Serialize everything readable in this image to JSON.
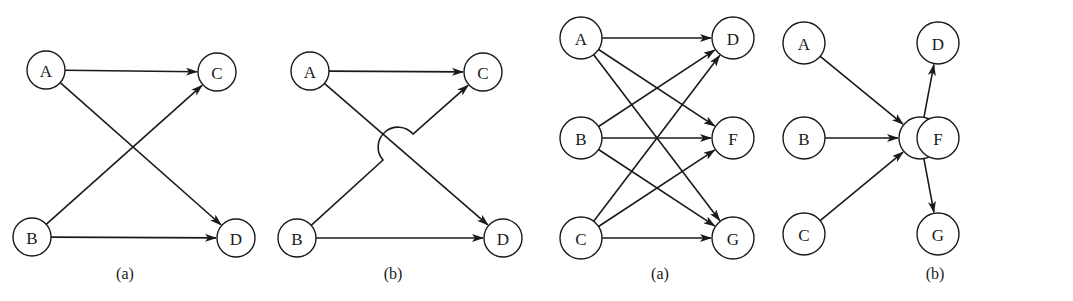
{
  "figures": [
    {
      "id": "fig1",
      "caption": "(a)",
      "caption_pos": [
        125,
        279
      ],
      "radius": 19,
      "nodes": [
        {
          "id": "A",
          "label": "A",
          "x": 46,
          "y": 70
        },
        {
          "id": "C",
          "label": "C",
          "x": 217,
          "y": 72
        },
        {
          "id": "B",
          "label": "B",
          "x": 32,
          "y": 237
        },
        {
          "id": "D",
          "label": "D",
          "x": 236,
          "y": 238
        }
      ],
      "edges": [
        {
          "from": "A",
          "to": "C"
        },
        {
          "from": "A",
          "to": "D"
        },
        {
          "from": "B",
          "to": "C"
        },
        {
          "from": "B",
          "to": "D"
        }
      ]
    },
    {
      "id": "fig2",
      "caption": "(b)",
      "caption_pos": [
        393,
        279
      ],
      "radius": 19,
      "nodes": [
        {
          "id": "A",
          "label": "A",
          "x": 310,
          "y": 71
        },
        {
          "id": "C",
          "label": "C",
          "x": 483,
          "y": 72
        },
        {
          "id": "B",
          "label": "B",
          "x": 297,
          "y": 238
        },
        {
          "id": "D",
          "label": "D",
          "x": 503,
          "y": 238
        }
      ],
      "edges": [
        {
          "from": "A",
          "to": "C"
        },
        {
          "from": "A",
          "to": "D"
        },
        {
          "from": "B",
          "to": "C",
          "hop": {
            "start": [
              383,
              160
            ],
            "end": [
              413,
              134
            ],
            "r": 16
          }
        },
        {
          "from": "B",
          "to": "D"
        }
      ]
    },
    {
      "id": "fig3",
      "caption": "(a)",
      "caption_pos": [
        660,
        279
      ],
      "radius": 21,
      "nodes": [
        {
          "id": "A",
          "label": "A",
          "x": 581,
          "y": 38
        },
        {
          "id": "B",
          "label": "B",
          "x": 581,
          "y": 138
        },
        {
          "id": "C",
          "label": "C",
          "x": 581,
          "y": 238
        },
        {
          "id": "D",
          "label": "D",
          "x": 733,
          "y": 38
        },
        {
          "id": "F",
          "label": "F",
          "x": 733,
          "y": 138
        },
        {
          "id": "G",
          "label": "G",
          "x": 733,
          "y": 238
        }
      ],
      "edges": [
        {
          "from": "A",
          "to": "D"
        },
        {
          "from": "A",
          "to": "F"
        },
        {
          "from": "A",
          "to": "G"
        },
        {
          "from": "B",
          "to": "D"
        },
        {
          "from": "B",
          "to": "F"
        },
        {
          "from": "B",
          "to": "G"
        },
        {
          "from": "C",
          "to": "D"
        },
        {
          "from": "C",
          "to": "F"
        },
        {
          "from": "C",
          "to": "G"
        }
      ]
    },
    {
      "id": "fig4",
      "caption": "(b)",
      "caption_pos": [
        935,
        279
      ],
      "radius": 21,
      "nodes": [
        {
          "id": "A",
          "label": "A",
          "x": 804,
          "y": 43
        },
        {
          "id": "B",
          "label": "B",
          "x": 804,
          "y": 138
        },
        {
          "id": "C",
          "label": "C",
          "x": 804,
          "y": 234
        },
        {
          "id": "X",
          "label": "",
          "x": 920,
          "y": 138
        },
        {
          "id": "D",
          "label": "D",
          "x": 1060,
          "y": 43
        },
        {
          "id": "F",
          "label": "F",
          "x": 1060,
          "y": 138
        },
        {
          "id": "G",
          "label": "G",
          "x": 1060,
          "y": 234
        }
      ],
      "edges": [
        {
          "from": "A",
          "to": "X"
        },
        {
          "from": "B",
          "to": "X"
        },
        {
          "from": "C",
          "to": "X"
        },
        {
          "from": "X",
          "to": "D"
        },
        {
          "from": "X",
          "to": "F"
        },
        {
          "from": "X",
          "to": "G"
        }
      ]
    }
  ],
  "colors": {
    "stroke": "#1a1a1a",
    "background": "#ffffff"
  }
}
